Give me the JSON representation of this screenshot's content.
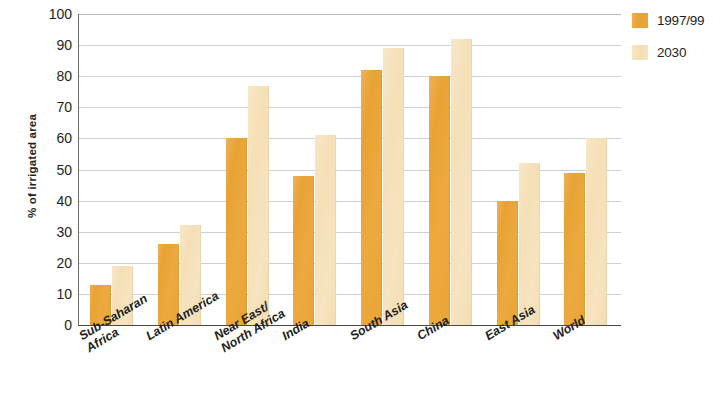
{
  "chart_data": {
    "type": "bar",
    "title": "",
    "subtitle": "",
    "xlabel": "",
    "ylabel": "% of irrigated area",
    "ylim": [
      0,
      100
    ],
    "yticks": [
      0,
      10,
      20,
      30,
      40,
      50,
      60,
      70,
      80,
      90,
      100
    ],
    "ytick_labels": [
      "0",
      "10",
      "20",
      "30",
      "40",
      "50",
      "60",
      "70",
      "80",
      "90",
      "100"
    ],
    "grid": true,
    "grid_axis": "y",
    "legend_position": "top-right",
    "categories": [
      "Sub-Saharan\nAfrica",
      "Latin America",
      "Near East/\nNorth Africa",
      "India",
      "South Asia",
      "China",
      "East Asia",
      "World"
    ],
    "series": [
      {
        "name": "1997/99",
        "color": "#E9A535",
        "values": [
          13,
          26,
          60,
          48,
          82,
          80,
          40,
          49
        ]
      },
      {
        "name": "2030",
        "color": "#F4DFB6",
        "values": [
          19,
          32,
          77,
          61,
          89,
          92,
          52,
          60
        ]
      }
    ]
  },
  "legend": {
    "items": [
      {
        "label": "1997/99",
        "color": "#E9A535"
      },
      {
        "label": "2030",
        "color": "#F4DFB6"
      }
    ]
  },
  "axes": {
    "y_title": "% of irrigated area"
  },
  "colors": {
    "series_1997_99": "#E9A535",
    "series_2030": "#F4DFB6",
    "gridline": "#CFCFD4",
    "axis": "#4A4746",
    "text": "#231F1E",
    "background": "#FFFFFF"
  }
}
